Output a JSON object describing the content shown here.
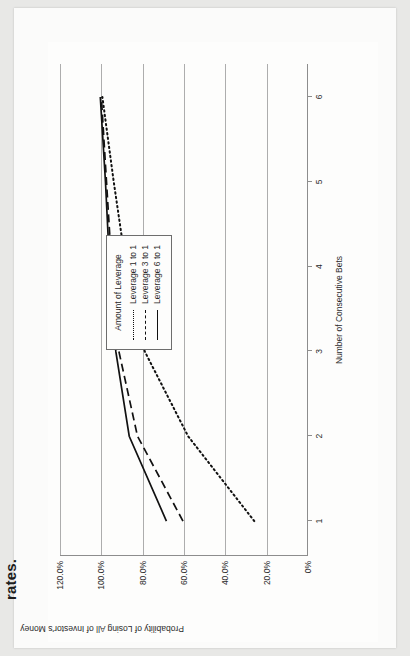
{
  "page": {
    "caption": "rates."
  },
  "chart_data": {
    "type": "line",
    "title": "",
    "xlabel": "Number of Consecutive Bets",
    "ylabel": "Probability of Losing All of Investor's Money",
    "x": [
      1,
      2,
      3,
      4,
      5,
      6
    ],
    "xlim": [
      0.6,
      6.4
    ],
    "ylim": [
      0,
      120
    ],
    "ytick_labels": [
      "0%",
      "20.0%",
      "40.0%",
      "60.0%",
      "80.0%",
      "100.0%",
      "120.0%"
    ],
    "ytick_values": [
      0,
      20,
      40,
      60,
      80,
      100,
      120
    ],
    "xtick_labels": [
      "1",
      "2",
      "3",
      "4",
      "5",
      "6"
    ],
    "grid": true,
    "legend_position": "center-right",
    "legend_title": "Amount of Leverage",
    "series": [
      {
        "name": "Leverage 1 to 1",
        "style": "dotted",
        "color": "#111111",
        "values": [
          26.0,
          58.0,
          79.0,
          88.0,
          94.0,
          99.5
        ]
      },
      {
        "name": "Leverage 3 to 1",
        "style": "dashed",
        "color": "#111111",
        "values": [
          60.5,
          82.5,
          91.5,
          95.0,
          97.5,
          100.0
        ]
      },
      {
        "name": "Leverage 6 to 1",
        "style": "solid",
        "color": "#111111",
        "values": [
          68.5,
          86.5,
          93.0,
          96.0,
          98.0,
          100.5
        ]
      }
    ]
  },
  "legend": {
    "title": "Amount of Leverage",
    "entries": [
      {
        "label": "Leverage 1 to 1"
      },
      {
        "label": "Leverage 3 to 1"
      },
      {
        "label": "Leverage 6 to 1"
      }
    ]
  }
}
